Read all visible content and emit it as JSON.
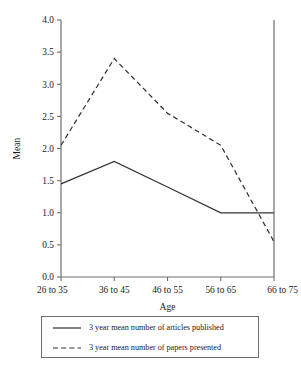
{
  "chart_data": {
    "type": "line",
    "title": "",
    "subtitle": "",
    "xlabel": "Age",
    "ylabel": "Mean",
    "categories": [
      "26 to 35",
      "36 to 45",
      "46 to 55",
      "56 to 65",
      "66 to 75"
    ],
    "ylim": [
      0.0,
      4.0
    ],
    "yticks": [
      "0.0",
      "0.5",
      "1.0",
      "1.5",
      "2.0",
      "2.5",
      "3.0",
      "3.5",
      "4.0"
    ],
    "ytick_values": [
      0.0,
      0.5,
      1.0,
      1.5,
      2.0,
      2.5,
      3.0,
      3.5,
      4.0
    ],
    "grid": false,
    "legend_position": "below",
    "series": [
      {
        "name": "3 year mean number of articles published",
        "style": "solid",
        "color": "#333333",
        "values": [
          1.45,
          1.8,
          1.4,
          1.0,
          1.0
        ]
      },
      {
        "name": "3 year mean number of papers presented",
        "style": "dashed",
        "color": "#333333",
        "values": [
          2.05,
          3.4,
          2.55,
          2.05,
          0.55
        ]
      }
    ],
    "annotations": []
  },
  "axis": {
    "y_title": "Mean",
    "x_title": "Age"
  },
  "legend": {
    "items": [
      {
        "sample": "solid-line-sample",
        "label": "3 year mean number of articles published"
      },
      {
        "sample": "dashed-line-sample",
        "label": "3 year mean number of papers presented"
      }
    ]
  },
  "colors": {
    "axis": "#6e6e6e",
    "series_line": "#333333",
    "text": "#1a1a1a",
    "background": "#ffffff"
  }
}
